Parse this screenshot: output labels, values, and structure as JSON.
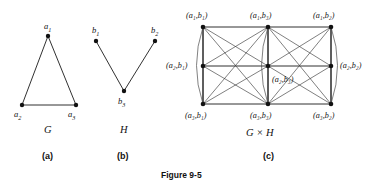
{
  "figure": {
    "caption": "Figure 9-5",
    "panels": [
      {
        "tag": "(a)",
        "graph_name": "G"
      },
      {
        "tag": "(b)",
        "graph_name": "H"
      },
      {
        "tag": "(c)",
        "graph_name": "G × H"
      }
    ]
  },
  "graph_g": {
    "name": "G",
    "tag": "(a)",
    "vertices": [
      {
        "id": "a1",
        "label": "a",
        "sub": "1",
        "x": 48,
        "y": 36
      },
      {
        "id": "a2",
        "label": "a",
        "sub": "2",
        "x": 22,
        "y": 105
      },
      {
        "id": "a3",
        "label": "a",
        "sub": "3",
        "x": 76,
        "y": 105
      }
    ],
    "edges": [
      [
        "a1",
        "a2"
      ],
      [
        "a1",
        "a3"
      ],
      [
        "a2",
        "a3"
      ]
    ]
  },
  "graph_h": {
    "name": "H",
    "tag": "(b)",
    "vertices": [
      {
        "id": "b1",
        "label": "b",
        "sub": "1",
        "x": 96,
        "y": 41
      },
      {
        "id": "b2",
        "label": "b",
        "sub": "2",
        "x": 155,
        "y": 41
      },
      {
        "id": "b3",
        "label": "b",
        "sub": "3",
        "x": 124,
        "y": 91
      }
    ],
    "edges": [
      [
        "b1",
        "b3"
      ],
      [
        "b2",
        "b3"
      ]
    ]
  },
  "graph_product": {
    "name": "G × H",
    "tag": "(c)",
    "vertex_labels": {
      "a1b1": "(a₁,b₁)",
      "a1b3": "(a₁,b₃)",
      "a1b2": "(a₁,b₂)",
      "a2b1": "(a₂,b₁)",
      "a2b3": "(a₂,b₃)",
      "a2b2": "(a₂,b₂)",
      "a3b1": "(a₃,b₁)",
      "a3b3": "(a₃,b₃)",
      "a3b2": "(a₃,b₂)"
    },
    "vertices": [
      {
        "id": "a1b1",
        "x": 203,
        "y": 27
      },
      {
        "id": "a1b3",
        "x": 268,
        "y": 27
      },
      {
        "id": "a1b2",
        "x": 331,
        "y": 27
      },
      {
        "id": "a2b1",
        "x": 203,
        "y": 66
      },
      {
        "id": "a2b3",
        "x": 268,
        "y": 66
      },
      {
        "id": "a2b2",
        "x": 331,
        "y": 66
      },
      {
        "id": "a3b1",
        "x": 203,
        "y": 104
      },
      {
        "id": "a3b3",
        "x": 268,
        "y": 104
      },
      {
        "id": "a3b2",
        "x": 331,
        "y": 104
      }
    ],
    "edges": [
      [
        "a1b1",
        "a1b3"
      ],
      [
        "a1b3",
        "a1b2"
      ],
      [
        "a2b1",
        "a2b3"
      ],
      [
        "a2b3",
        "a2b2"
      ],
      [
        "a3b1",
        "a3b3"
      ],
      [
        "a3b3",
        "a3b2"
      ],
      [
        "a1b1",
        "a2b1"
      ],
      [
        "a2b1",
        "a3b1"
      ],
      [
        "a1b3",
        "a2b3"
      ],
      [
        "a2b3",
        "a3b3"
      ],
      [
        "a1b2",
        "a2b2"
      ],
      [
        "a2b2",
        "a3b2"
      ],
      [
        "a1b1",
        "a2b3"
      ],
      [
        "a1b3",
        "a2b1"
      ],
      [
        "a1b3",
        "a2b2"
      ],
      [
        "a1b2",
        "a2b3"
      ],
      [
        "a2b1",
        "a3b3"
      ],
      [
        "a2b3",
        "a3b1"
      ],
      [
        "a2b3",
        "a3b2"
      ],
      [
        "a2b2",
        "a3b3"
      ],
      [
        "a1b1",
        "a3b3"
      ],
      [
        "a1b3",
        "a3b1"
      ],
      [
        "a1b3",
        "a3b2"
      ],
      [
        "a1b2",
        "a3b3"
      ],
      [
        "a1b1",
        "a3b1"
      ],
      [
        "a1b3",
        "a3b3"
      ],
      [
        "a1b2",
        "a3b2"
      ]
    ],
    "arcs": [
      {
        "from": "a1b1",
        "to": "a3b1",
        "side": "left"
      },
      {
        "from": "a1b3",
        "to": "a3b3",
        "side": "left"
      },
      {
        "from": "a1b2",
        "to": "a3b2",
        "side": "right"
      }
    ]
  }
}
